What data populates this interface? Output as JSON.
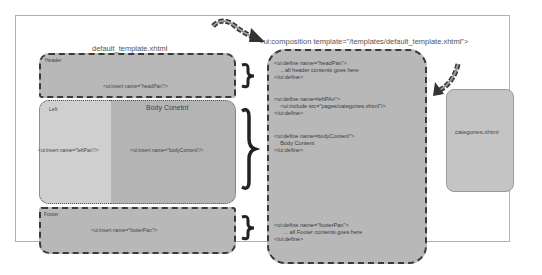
{
  "template": {
    "title": "default_template.xhtml",
    "header": {
      "label": "Header",
      "insert": "<ui:insert name=\"headPan\"/>"
    },
    "body": {
      "title": "Body Conetnt",
      "insert": "<ui:insert name=\"bodyContent\"/>"
    },
    "left": {
      "label": "Left",
      "insert": "<ui:insert name=\"leftPan\"/>"
    },
    "footer": {
      "label": "Footer",
      "insert": "<ui:insert name=\"footerPan\"/>"
    }
  },
  "composition": {
    "title": "<ui:composition template=\"/templates/default_template.xhtml\">",
    "header_block": [
      "<ui:define name=\"headPan\">",
      "    ...all header contents goes here",
      "</ui:define>"
    ],
    "left_block": [
      "<ui:define name=leftPAn\">",
      "    <ui:include src=\"pages/categories.xhtml\"/>",
      "</ui:define>"
    ],
    "body_block": [
      "<ui:define name=bodyContent\">",
      "    Body Content",
      "</ui:define>"
    ],
    "footer_block": [
      "<ui:define name=\"footerPan\">",
      "      ... all Footer contents goes here",
      "</ui:define>"
    ]
  },
  "include": {
    "label": "categories.xhtml"
  },
  "colors": {
    "box_fill": "#b8b8b8",
    "left_fill": "#cfcfcf",
    "dash": "#3a3a3a",
    "include_fill": "#c4c4c4"
  }
}
